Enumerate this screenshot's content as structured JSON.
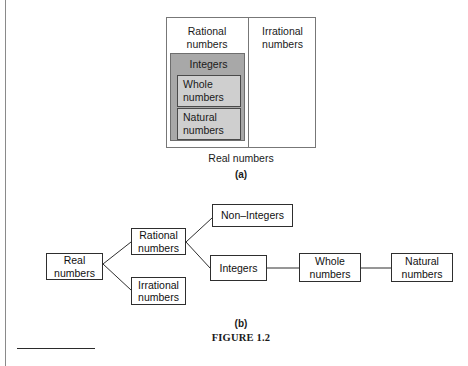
{
  "figure": {
    "caption": "FIGURE 1.2",
    "part_a_label": "(a)",
    "part_b_label": "(b)"
  },
  "diagram_a": {
    "outer_caption": "Real numbers",
    "columns": [
      {
        "name": "rational",
        "label": "Rational\nnumbers"
      },
      {
        "name": "irrational",
        "label": "Irrational\nnumbers"
      }
    ],
    "nested": [
      {
        "name": "integers",
        "label": "Integers",
        "fill": "#a8a8a8"
      },
      {
        "name": "whole",
        "label": "Whole\nnumbers",
        "fill": "#cfcfcf"
      },
      {
        "name": "natural",
        "label": "Natural\nnumbers",
        "fill": "#cfcfcf"
      }
    ]
  },
  "diagram_b": {
    "nodes": [
      {
        "name": "real",
        "label": "Real\nnumbers"
      },
      {
        "name": "rational",
        "label": "Rational\nnumbers"
      },
      {
        "name": "irrational",
        "label": "Irrational\nnumbers"
      },
      {
        "name": "non-integers",
        "label": "Non–Integers"
      },
      {
        "name": "integers",
        "label": "Integers"
      },
      {
        "name": "whole",
        "label": "Whole\nnumbers"
      },
      {
        "name": "natural",
        "label": "Natural\nnumbers"
      }
    ],
    "edges": [
      {
        "from": "real",
        "to": "rational"
      },
      {
        "from": "real",
        "to": "irrational"
      },
      {
        "from": "rational",
        "to": "non-integers"
      },
      {
        "from": "rational",
        "to": "integers"
      },
      {
        "from": "integers",
        "to": "whole"
      },
      {
        "from": "whole",
        "to": "natural"
      }
    ]
  },
  "colors": {
    "line": "#2e2e2e",
    "venn_border": "#777777",
    "page_rule": "#8a8a8a"
  }
}
